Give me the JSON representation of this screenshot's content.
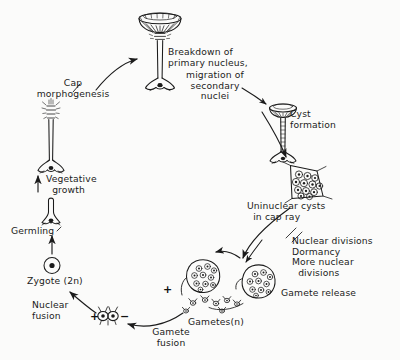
{
  "figure": {
    "background_color": "#fbfbfa",
    "ink_color": "#1b1b1b"
  },
  "labels": {
    "cap_morphogenesis": "Cap\nmorphogenesis",
    "breakdown_primary_nucleus": "Breakdown of\nprimary nucleus,",
    "migration_secondary_nuclei": "migration of\nsecondary\nnuclei",
    "cyst_formation": "Cyst\nformation",
    "uninuclear_cysts": "Uninuclear cysts\n  in cap ray",
    "nuclear_divisions_block": "Nuclear divisions\nDormancy\nMore nuclear\n  divisions",
    "gamete_release": "Gamete release",
    "gametes_n": "Gametes(n)",
    "gamete_fusion": "Gamete\nfusion",
    "nuclear_fusion": "Nuclear\nfusion",
    "zygote_2n": "Zygote (2n)",
    "germling": "Germling",
    "vegetative_growth": "Vegetative\n  growth"
  },
  "signs": {
    "plus_left_gametes": "+",
    "plus_zygote_pair": "+",
    "minus_zygote_pair": "−"
  },
  "stages": [
    {
      "name": "mature-alga-with-cap",
      "caption": "Breakdown of primary nucleus, migration of secondary nuclei"
    },
    {
      "name": "cap-ray-releasing",
      "caption": "Cyst formation"
    },
    {
      "name": "uninuclear-cyst-cluster",
      "caption": "Uninuclear cysts in cap ray"
    },
    {
      "name": "gamete-filled-cysts",
      "caption": "Nuclear divisions, Dormancy, More nuclear divisions"
    },
    {
      "name": "released-gametes",
      "caption": "Gametes(n)"
    },
    {
      "name": "fusing-gamete-pair",
      "caption": "Gamete fusion"
    },
    {
      "name": "zygote",
      "caption": "Zygote (2n)"
    },
    {
      "name": "germling",
      "caption": "Germling"
    },
    {
      "name": "vegetative-stalk",
      "caption": "Vegetative growth"
    }
  ]
}
